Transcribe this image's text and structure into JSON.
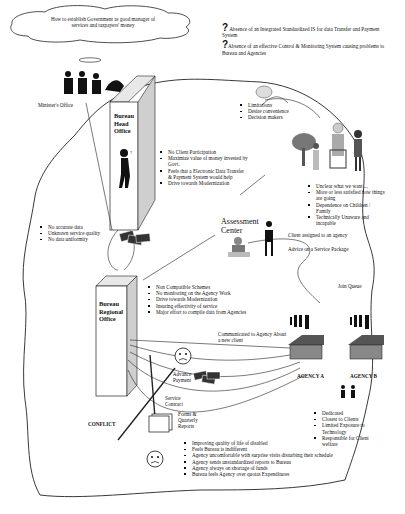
{
  "title_cloud": {
    "text": "How to establish Government as good manager of services and taxpayers' money"
  },
  "problems": [
    {
      "icon": "question-mark-icon",
      "text": "Absence of an Integrated Standardized IS for data Transfer and Payment System"
    },
    {
      "icon": "question-mark-icon",
      "text": "Absence of an effective Control & Monitoring System causing problems to Bureau and Agencies"
    }
  ],
  "minister": {
    "label": "Minister's Office"
  },
  "head_office": {
    "label_lines": [
      "Bureau",
      "Head",
      "Office"
    ],
    "bullets": [
      "No Client Participation",
      "Maximize value of money invested by Govt.",
      "Feels that a Electronic Data Transfer & Payment System would help",
      "Drive towards Modernization"
    ]
  },
  "client_group": {
    "bullets_top": [
      "Limitations",
      "Desire convenience",
      "Decision makers"
    ],
    "bullets_bottom": [
      "Unclear what we want ...",
      "More or less satisfied how things are going",
      "Dependence on Children / Family",
      "Technically Unaware and incapable"
    ]
  },
  "data_issues": {
    "bullets": [
      "No accurate data",
      "Unknown service quality",
      "No data uniformity"
    ]
  },
  "assessment": {
    "label_lines": [
      "Assessment",
      "Center"
    ],
    "flows": [
      "Client assigned to an agency",
      "Advice on a Service Package",
      "Join Queue"
    ]
  },
  "regional_office": {
    "label_lines": [
      "Bureau",
      "Regional",
      "Office"
    ],
    "bullets": [
      "Non Compatible Schemes",
      "No monitoring on the Agency Work",
      "Drive towards Modernization",
      "Insuring effectivity of service",
      "Major effort to compile data from Agencies"
    ]
  },
  "flows": {
    "communicated": "Communicated to Agency About a new client",
    "advance_payment": "Advance Payment",
    "service_contract": "Service Contract",
    "forms": "Forms & Quarterly Reports",
    "conflict": "CONFLICT"
  },
  "agencies": [
    {
      "label": "AGENCY A"
    },
    {
      "label": "AGENCY B"
    }
  ],
  "agency_traits": {
    "bullets": [
      "Dedicated",
      "Closest to Clients",
      "Limited Exposure to Technology",
      "Responsible for Client welfare"
    ]
  },
  "agency_issues": {
    "bullets": [
      "Improving quality of life of disabled",
      "Feels Bureau is indifferent",
      "Agency uncomfortable with surprise visits disturbing their schedule",
      "Agency sends unstandardized reports to Bureau",
      "Agency always on shortage of funds",
      "Bureau feels Agency over quotas Expenditures"
    ]
  }
}
